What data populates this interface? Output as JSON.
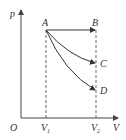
{
  "diagram": {
    "type": "p-V diagram",
    "axes": {
      "y_label": "p",
      "x_label": "V",
      "origin_label": "O"
    },
    "x_ticks": [
      {
        "main": "V",
        "sub": "1"
      },
      {
        "main": "V",
        "sub": "2"
      }
    ],
    "points": {
      "A": "A",
      "B": "B",
      "C": "C",
      "D": "D"
    },
    "processes": [
      {
        "from": "A",
        "to": "B",
        "kind": "isobaric",
        "shape": "straight"
      },
      {
        "from": "A",
        "to": "C",
        "kind": "curve",
        "shape": "concave"
      },
      {
        "from": "A",
        "to": "D",
        "kind": "curve",
        "shape": "concave"
      }
    ],
    "guides": [
      "dashed vertical at V1",
      "dashed vertical at V2"
    ]
  }
}
